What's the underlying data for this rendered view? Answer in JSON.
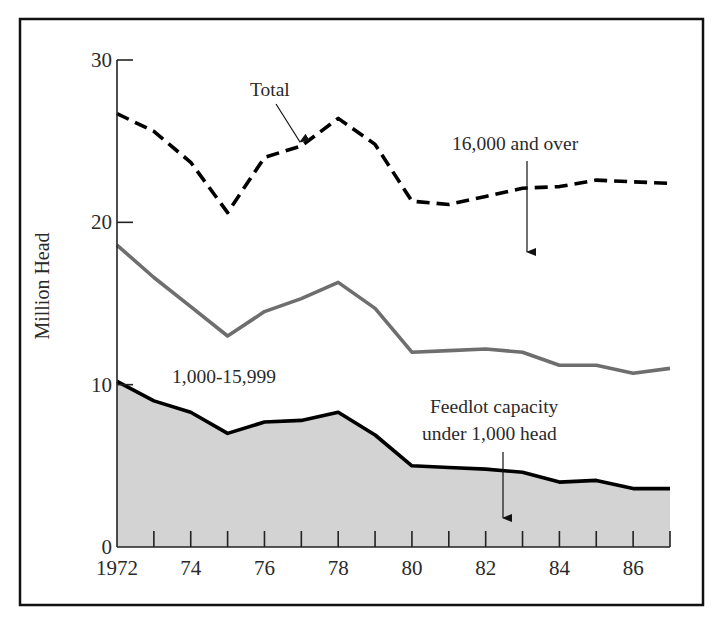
{
  "chart_data": {
    "type": "area",
    "title": "",
    "xlabel": "",
    "ylabel": "Million Head",
    "xlim": [
      1972,
      1987
    ],
    "ylim": [
      0,
      30
    ],
    "grid": false,
    "x": [
      1972,
      1973,
      1974,
      1975,
      1976,
      1977,
      1978,
      1979,
      1980,
      1981,
      1982,
      1983,
      1984,
      1985,
      1986,
      1987
    ],
    "x_tick_labels": [
      {
        "value": 1972,
        "label": "1972"
      },
      {
        "value": 1974,
        "label": "74"
      },
      {
        "value": 1976,
        "label": "76"
      },
      {
        "value": 1978,
        "label": "78"
      },
      {
        "value": 1980,
        "label": "80"
      },
      {
        "value": 1982,
        "label": "82"
      },
      {
        "value": 1984,
        "label": "84"
      },
      {
        "value": 1986,
        "label": "86"
      }
    ],
    "y_tick_labels": [
      {
        "value": 0,
        "label": "0"
      },
      {
        "value": 10,
        "label": "10"
      },
      {
        "value": 20,
        "label": "20"
      },
      {
        "value": 30,
        "label": "30"
      }
    ],
    "series": [
      {
        "name": "Total",
        "style": "dashed",
        "color": "#000000",
        "values": [
          26.7,
          25.6,
          23.7,
          20.6,
          24.0,
          24.7,
          26.4,
          24.8,
          21.3,
          21.1,
          21.6,
          22.1,
          22.2,
          22.6,
          22.5,
          22.4
        ]
      },
      {
        "name": "Under 1,000 + 1,000-15,999 (cumulative)",
        "style": "solid",
        "color": "#6e6e6e",
        "values": [
          18.6,
          16.6,
          14.8,
          13.0,
          14.5,
          15.3,
          16.3,
          14.7,
          12.0,
          12.1,
          12.2,
          12.0,
          11.2,
          11.2,
          10.7,
          11.0
        ]
      },
      {
        "name": "Feedlot capacity under 1,000 head",
        "style": "solid-filled",
        "color": "#000000",
        "fill": "#d3d3d3",
        "values": [
          10.2,
          9.0,
          8.3,
          7.0,
          7.7,
          7.8,
          8.3,
          6.9,
          5.0,
          4.9,
          4.8,
          4.6,
          4.0,
          4.1,
          3.6,
          3.6
        ]
      }
    ],
    "annotations": [
      {
        "id": "total",
        "text": "Total",
        "x": 250,
        "y": 96,
        "arrow": [
          276,
          104,
          300,
          142
        ]
      },
      {
        "id": "over16000",
        "text": "16,000 and over",
        "x": 452,
        "y": 150,
        "arrow": [
          527,
          161,
          527,
          252
        ]
      },
      {
        "id": "mid",
        "text": "1,000-15,999",
        "x": 172,
        "y": 383,
        "arrow": null
      },
      {
        "id": "under1000_l1",
        "text": "Feedlot capacity",
        "x": 430,
        "y": 413,
        "arrow": null
      },
      {
        "id": "under1000_l2",
        "text": "under 1,000 head",
        "x": 422,
        "y": 440,
        "arrow": [
          503,
          452,
          503,
          518
        ]
      }
    ],
    "legend": null
  },
  "layout": {
    "frame": {
      "x": 20,
      "y": 19,
      "w": 683,
      "h": 586
    },
    "plot": {
      "x0": 117,
      "x1": 670,
      "y0": 547,
      "y30": 60
    }
  }
}
